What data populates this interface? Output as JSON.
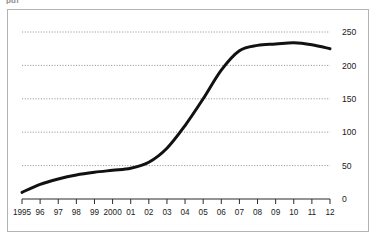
{
  "figure": {
    "clipped_caption": "pdf",
    "frame_color": "#b3b3b3",
    "background": "#ffffff"
  },
  "chart_data": {
    "type": "line",
    "title": "",
    "subtitle": "",
    "xlabel": "",
    "ylabel": "",
    "grid": true,
    "grid_style": "dotted",
    "grid_color": "#8a8a8a",
    "legend": "none",
    "line_color": "#111111",
    "line_width": 3,
    "axis_position": {
      "y_axis": "right",
      "x_axis": "bottom"
    },
    "xlim": [
      1995,
      2012
    ],
    "ylim": [
      0,
      250
    ],
    "yticks": [
      0,
      50,
      100,
      150,
      200,
      250
    ],
    "ytick_labels": [
      "0",
      "50",
      "100",
      "150",
      "200",
      "250"
    ],
    "categories": [
      "1995",
      "96",
      "97",
      "98",
      "99",
      "2000",
      "01",
      "02",
      "03",
      "04",
      "05",
      "06",
      "07",
      "08",
      "09",
      "10",
      "11",
      "12"
    ],
    "x": [
      1995,
      1996,
      1997,
      1998,
      1999,
      2000,
      2001,
      2002,
      2003,
      2004,
      2005,
      2006,
      2007,
      2008,
      2009,
      2010,
      2011,
      2012
    ],
    "values": [
      10,
      22,
      30,
      36,
      40,
      43,
      46,
      55,
      76,
      110,
      150,
      193,
      222,
      230,
      232,
      234,
      231,
      225
    ]
  },
  "axes": {
    "x_tick_labels": [
      "1995",
      "96",
      "97",
      "98",
      "99",
      "2000",
      "01",
      "02",
      "03",
      "04",
      "05",
      "06",
      "07",
      "08",
      "09",
      "10",
      "11",
      "12"
    ],
    "y_tick_labels": [
      "250",
      "200",
      "150",
      "100",
      "50",
      "0"
    ]
  }
}
